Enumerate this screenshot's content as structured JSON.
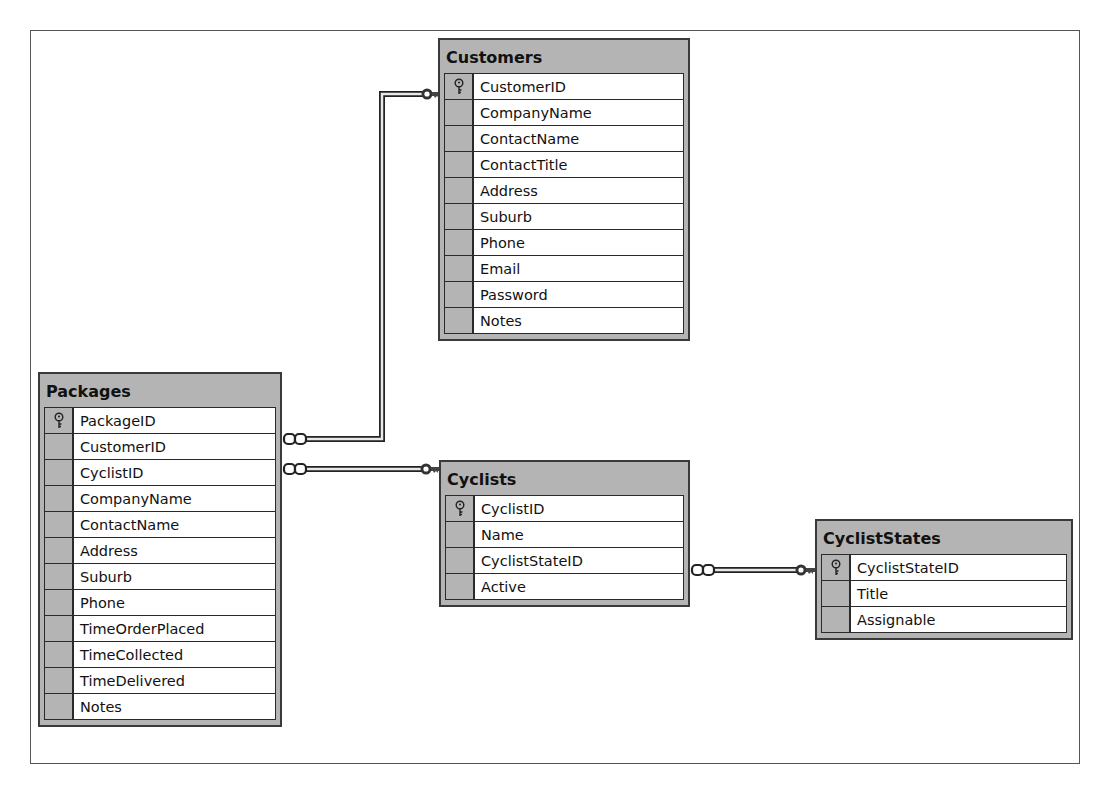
{
  "diagram": {
    "tables": {
      "customers": {
        "title": "Customers",
        "columns": [
          {
            "name": "CustomerID",
            "primary_key": true
          },
          {
            "name": "CompanyName",
            "primary_key": false
          },
          {
            "name": "ContactName",
            "primary_key": false
          },
          {
            "name": "ContactTitle",
            "primary_key": false
          },
          {
            "name": "Address",
            "primary_key": false
          },
          {
            "name": "Suburb",
            "primary_key": false
          },
          {
            "name": "Phone",
            "primary_key": false
          },
          {
            "name": "Email",
            "primary_key": false
          },
          {
            "name": "Password",
            "primary_key": false
          },
          {
            "name": "Notes",
            "primary_key": false
          }
        ]
      },
      "packages": {
        "title": "Packages",
        "columns": [
          {
            "name": "PackageID",
            "primary_key": true
          },
          {
            "name": "CustomerID",
            "primary_key": false
          },
          {
            "name": "CyclistID",
            "primary_key": false
          },
          {
            "name": "CompanyName",
            "primary_key": false
          },
          {
            "name": "ContactName",
            "primary_key": false
          },
          {
            "name": "Address",
            "primary_key": false
          },
          {
            "name": "Suburb",
            "primary_key": false
          },
          {
            "name": "Phone",
            "primary_key": false
          },
          {
            "name": "TimeOrderPlaced",
            "primary_key": false
          },
          {
            "name": "TimeCollected",
            "primary_key": false
          },
          {
            "name": "TimeDelivered",
            "primary_key": false
          },
          {
            "name": "Notes",
            "primary_key": false
          }
        ]
      },
      "cyclists": {
        "title": "Cyclists",
        "columns": [
          {
            "name": "CyclistID",
            "primary_key": true
          },
          {
            "name": "Name",
            "primary_key": false
          },
          {
            "name": "CyclistStateID",
            "primary_key": false
          },
          {
            "name": "Active",
            "primary_key": false
          }
        ]
      },
      "cyclist_states": {
        "title": "CyclistStates",
        "columns": [
          {
            "name": "CyclistStateID",
            "primary_key": true
          },
          {
            "name": "Title",
            "primary_key": false
          },
          {
            "name": "Assignable",
            "primary_key": false
          }
        ]
      }
    },
    "relationships": [
      {
        "from": "Packages.CustomerID",
        "to": "Customers.CustomerID",
        "type": "many-to-one"
      },
      {
        "from": "Packages.CyclistID",
        "to": "Cyclists.CyclistID",
        "type": "many-to-one"
      },
      {
        "from": "Cyclists.CyclistStateID",
        "to": "CyclistStates.CyclistStateID",
        "type": "many-to-one"
      }
    ],
    "icons": {
      "primary_key": "key-icon",
      "many_end": "infinity-icon",
      "one_end": "key-icon"
    },
    "colors": {
      "table_chrome": "#b4b4b4",
      "border": "#2a2a2a",
      "canvas": "#ffffff"
    }
  }
}
